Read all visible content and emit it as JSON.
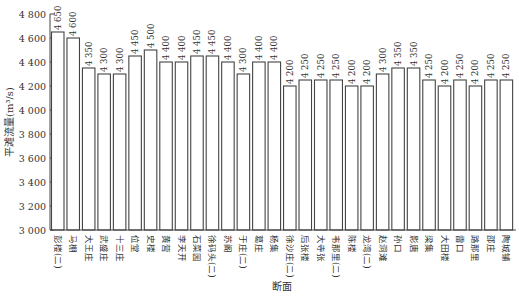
{
  "chart_data": {
    "type": "bar",
    "title": "",
    "xlabel": "断面",
    "ylabel": "平滩流量(m³/s)",
    "ylim": [
      3000,
      4800
    ],
    "yticks": [
      3000,
      3200,
      3400,
      3600,
      3800,
      4000,
      4200,
      4400,
      4600,
      4800
    ],
    "ytick_labels": [
      "3 000",
      "3 200",
      "3 400",
      "3 600",
      "3 800",
      "4 000",
      "4 200",
      "4 400",
      "4 600",
      "4 800"
    ],
    "grid": false,
    "legend": null,
    "categories": [
      "彭楼(二)",
      "马棚",
      "大王庄",
      "武盛庄",
      "十三庄",
      "位堂",
      "史楼",
      "黄营",
      "李天开",
      "石菜园",
      "徐码头(二)",
      "苏阁",
      "于庄(二)",
      "葛庄",
      "杨集",
      "徐沙庄(二)",
      "后张楼",
      "大寺张",
      "韦那里(二)",
      "陈楼",
      "龙湾(二)",
      "赵洞滩",
      "孙口",
      "影唐",
      "梁集",
      "大田楼",
      "雷口",
      "路那里",
      "邵庄",
      "陶城铺"
    ],
    "values": [
      4650,
      4600,
      4350,
      4300,
      4300,
      4450,
      4500,
      4400,
      4400,
      4450,
      4450,
      4400,
      4300,
      4400,
      4400,
      4200,
      4250,
      4250,
      4250,
      4200,
      4200,
      4300,
      4350,
      4350,
      4250,
      4200,
      4250,
      4200,
      4250,
      4250
    ],
    "value_labels": [
      "4 650",
      "4 600",
      "4 350",
      "4 300",
      "4 300",
      "4 450",
      "4 500",
      "4 400",
      "4 400",
      "4 450",
      "4 450",
      "4 400",
      "4 300",
      "4 400",
      "4 400",
      "4 200",
      "4 250",
      "4 250",
      "4 250",
      "4 200",
      "4 200",
      "4 300",
      "4 350",
      "4 350",
      "4 250",
      "4 200",
      "4 250",
      "4 200",
      "4 250",
      "4 250"
    ]
  },
  "colors": {
    "bar_fill": "#ffffff",
    "bar_stroke": "#444444",
    "axis": "#444444"
  }
}
